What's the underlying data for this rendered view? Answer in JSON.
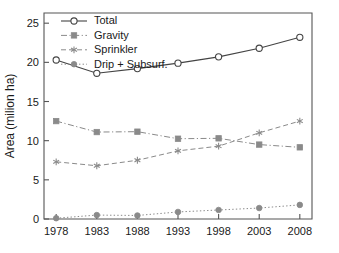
{
  "chart_data": {
    "type": "line",
    "title": "",
    "xlabel": "",
    "ylabel": "Area (milion ha)",
    "x": [
      1978,
      1983,
      1988,
      1993,
      1998,
      2003,
      2008
    ],
    "xticklabels": [
      "1978",
      "1983",
      "1988",
      "1993",
      "1998",
      "2003",
      "2008"
    ],
    "yticklabels": [
      "0",
      "5",
      "10",
      "15",
      "20",
      "25"
    ],
    "yticks": [
      0,
      5,
      10,
      15,
      20,
      25
    ],
    "xlim": [
      1976.5,
      2009.5
    ],
    "ylim": [
      0,
      26.3
    ],
    "grid": false,
    "legend_position": "top-left",
    "series": [
      {
        "name": "Total",
        "marker": "open-circle",
        "linestyle": "solid",
        "color": "#444444",
        "values": [
          20.3,
          18.6,
          19.2,
          19.9,
          20.7,
          21.8,
          23.2
        ]
      },
      {
        "name": "Gravity",
        "marker": "filled-square",
        "linestyle": "dashdot",
        "color": "#8a8a8a",
        "values": [
          12.5,
          11.1,
          11.15,
          10.25,
          10.3,
          9.5,
          9.15
        ]
      },
      {
        "name": "Sprinkler",
        "marker": "star",
        "linestyle": "dashed",
        "color": "#8a8a8a",
        "values": [
          7.3,
          6.8,
          7.5,
          8.7,
          9.3,
          11.0,
          12.5
        ]
      },
      {
        "name": "Drip + Subsurf.",
        "marker": "filled-circle",
        "linestyle": "dotted",
        "color": "#8a8a8a",
        "values": [
          0.1,
          0.5,
          0.45,
          0.9,
          1.15,
          1.4,
          1.8
        ]
      }
    ]
  },
  "legend": {
    "entries": [
      {
        "label": "Total"
      },
      {
        "label": "Gravity"
      },
      {
        "label": "Sprinkler"
      },
      {
        "label": "Drip + Subsurf."
      }
    ]
  },
  "colors": {
    "axis": "#555555",
    "total": "#444444",
    "secondary": "#8a8a8a",
    "background": "#ffffff"
  }
}
